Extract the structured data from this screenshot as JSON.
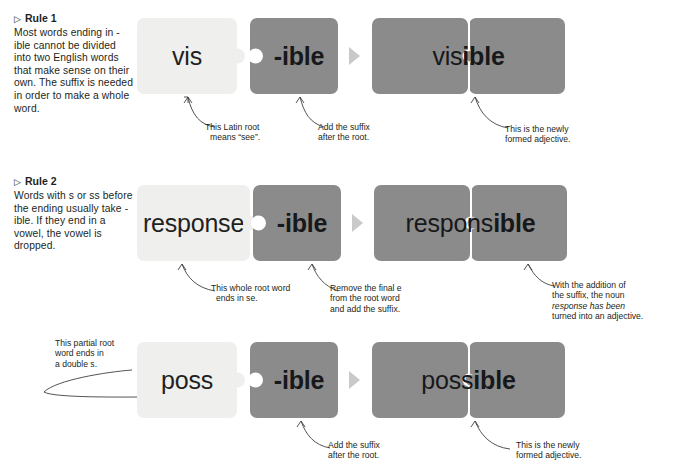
{
  "page": {
    "background": "#ffffff",
    "piece_light_color": "#efefee",
    "piece_dark_color": "#8b8b8b",
    "text_color": "#231f20"
  },
  "rules": [
    {
      "marker": "▷",
      "title": "Rule 1",
      "body": "Most words ending in -ible cannot be divided into two English words that make sense on their own. The suffix is needed in order to make a whole word."
    },
    {
      "marker": "▷",
      "title": "Rule 2",
      "body": "Words with s or ss before the ending usually take -ible. If they end in a vowel, the vowel is dropped."
    }
  ],
  "rows": [
    {
      "id": "row-visible",
      "root_piece": "vis",
      "suffix_piece": "-ible",
      "result_left": "vis",
      "result_right": "ible",
      "callouts": [
        {
          "id": "root-note",
          "lines": [
            "This Latin root",
            "means “see”."
          ]
        },
        {
          "id": "suffix-note",
          "lines": [
            "Add the suffix",
            "after the root."
          ]
        },
        {
          "id": "result-note",
          "lines": [
            "This is the newly",
            "formed adjective."
          ]
        }
      ]
    },
    {
      "id": "row-responsible",
      "root_piece": "response",
      "suffix_piece": "-ible",
      "result_left": "respons",
      "result_right": "ible",
      "callouts": [
        {
          "id": "root-note",
          "lines": [
            "This whole root word",
            "ends in se."
          ]
        },
        {
          "id": "suffix-note",
          "lines": [
            "Remove the final e",
            "from the root word",
            "and add the suffix."
          ]
        },
        {
          "id": "result-note",
          "lines": [
            "With the addition of",
            "the suffix, the noun",
            "response has been",
            "turned into an adjective."
          ]
        }
      ]
    },
    {
      "id": "row-possible",
      "root_piece": "poss",
      "suffix_piece": "-ible",
      "result_left": "poss",
      "result_right": "ible",
      "callouts": [
        {
          "id": "root-note",
          "lines": [
            "This partial root",
            "word ends in",
            "a double s."
          ]
        },
        {
          "id": "suffix-note",
          "lines": [
            "Add the suffix",
            "after the root."
          ]
        },
        {
          "id": "result-note",
          "lines": [
            "This is the newly",
            "formed adjective."
          ]
        }
      ]
    }
  ]
}
